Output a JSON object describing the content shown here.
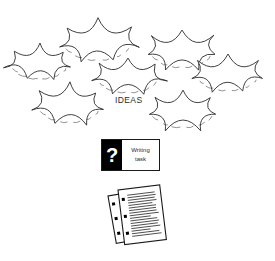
{
  "scene": {
    "title": "Brainstorming ideas leading to a writing task and written pages",
    "background_color": "#ffffff",
    "ink_color": "#2b2b2b"
  },
  "clouds": {
    "label": "IDEAS",
    "count": 7,
    "icon": "thought-cloud-icon",
    "items": [
      {
        "name": "cloud-top-center",
        "cx": 98,
        "cy": 42,
        "rx": 39,
        "ry": 22,
        "bumps": 7
      },
      {
        "name": "cloud-top-right",
        "cx": 182,
        "cy": 50,
        "rx": 36,
        "ry": 21,
        "bumps": 7
      },
      {
        "name": "cloud-mid-left",
        "cx": 40,
        "cy": 63,
        "rx": 33,
        "ry": 19,
        "bumps": 7
      },
      {
        "name": "cloud-mid-center",
        "cx": 128,
        "cy": 76,
        "rx": 36,
        "ry": 20,
        "bumps": 7
      },
      {
        "name": "cloud-mid-right",
        "cx": 228,
        "cy": 74,
        "rx": 36,
        "ry": 20,
        "bumps": 7
      },
      {
        "name": "cloud-bottom-left",
        "cx": 70,
        "cy": 105,
        "rx": 36,
        "ry": 21,
        "bumps": 7
      },
      {
        "name": "cloud-bottom-right",
        "cx": 183,
        "cy": 110,
        "rx": 37,
        "ry": 21,
        "bumps": 7
      }
    ]
  },
  "task_card": {
    "question_mark": "?",
    "line1": "Writing",
    "line2": "task",
    "border_color": "#1a1a1a",
    "badge_color": "#000000"
  },
  "papers": {
    "icon": "lined-paper-stack-icon",
    "sheet_count": 2,
    "back_sheet": {
      "name": "paper-sheet-back",
      "holes": 3
    },
    "front_sheet": {
      "name": "paper-sheet-front",
      "holes": 3,
      "text_lines": 17
    }
  }
}
